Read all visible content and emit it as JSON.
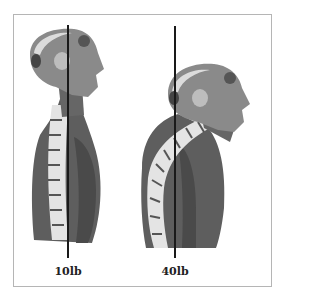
{
  "diagram": {
    "figures": [
      {
        "id": "neutral",
        "posture": "upright head aligned over spine",
        "load_label": "10lb"
      },
      {
        "id": "forward",
        "posture": "head jutting forward, spine curved",
        "load_label": "40lb"
      }
    ],
    "colors": {
      "line": "#1a1a1a",
      "frame": "#b5b5b5",
      "muscle": "#5a5a5a",
      "bone": "#e6e6e6",
      "skull": "#d9d9d9"
    }
  }
}
